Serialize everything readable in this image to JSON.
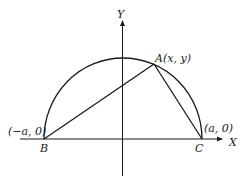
{
  "diagram": {
    "type": "semicircle-triangle",
    "axes": {
      "x_label": "X",
      "y_label": "Y"
    },
    "points": {
      "A": {
        "name": "A",
        "coords": "(x, y)"
      },
      "B": {
        "name": "B",
        "coords": "(−a, 0)"
      },
      "C": {
        "name": "C",
        "coords": "(a, 0)"
      }
    },
    "colors": {
      "stroke": "#1a1a1a",
      "background": "#ffffff"
    }
  }
}
